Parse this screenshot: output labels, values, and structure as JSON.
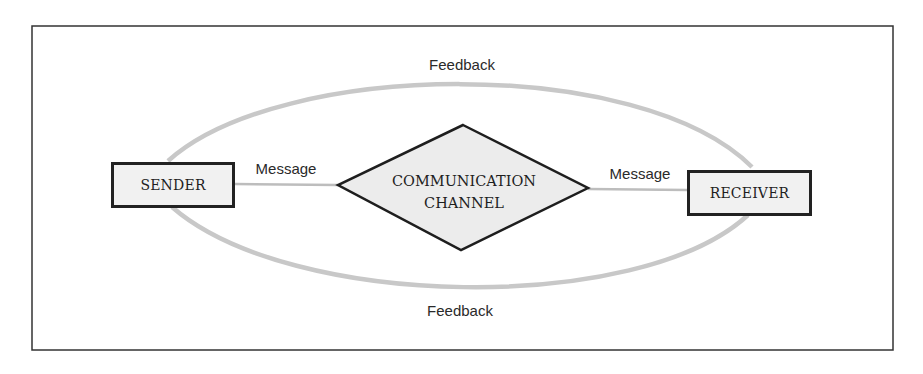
{
  "diagram": {
    "type": "communication-model",
    "nodes": {
      "sender": {
        "label": "SENDER"
      },
      "channel": {
        "line1": "COMMUNICATION",
        "line2": "CHANNEL"
      },
      "receiver": {
        "label": "RECEIVER"
      }
    },
    "edges": {
      "message_left": "Message",
      "message_right": "Message",
      "feedback_top": "Feedback",
      "feedback_bottom": "Feedback"
    },
    "colors": {
      "frame": "#333333",
      "box_border": "#222222",
      "box_fill": "#f1f1f1",
      "feedback_arc": "#c8c8c8",
      "message_line": "#bdbdbd",
      "diamond_fill": "#ececec"
    }
  }
}
